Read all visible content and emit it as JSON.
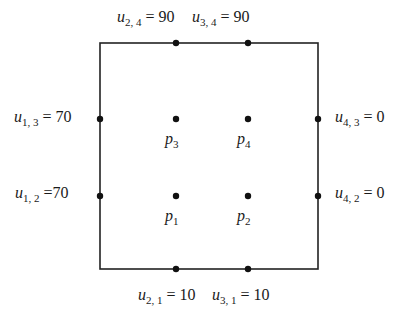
{
  "diagram": {
    "type": "grid-boundary-value-problem",
    "box": {
      "x": 100,
      "y": 43,
      "width": 218,
      "height": 226,
      "stroke": "#222222"
    },
    "boundary_labels": [
      {
        "id": "u24",
        "var": "u",
        "sub": "2, 4",
        "eq": "= 90",
        "x": 117,
        "y": 9
      },
      {
        "id": "u34",
        "var": "u",
        "sub": "3, 4",
        "eq": "= 90",
        "x": 192,
        "y": 9
      },
      {
        "id": "u13",
        "var": "u",
        "sub": "1, 3",
        "eq": "= 70",
        "x": 14,
        "y": 109
      },
      {
        "id": "u12",
        "var": "u",
        "sub": "1, 2",
        "eq": "=70",
        "x": 15,
        "y": 185
      },
      {
        "id": "u43",
        "var": "u",
        "sub": "4, 3",
        "eq": "= 0",
        "x": 335,
        "y": 109
      },
      {
        "id": "u42",
        "var": "u",
        "sub": "4, 2",
        "eq": "= 0",
        "x": 335,
        "y": 185
      },
      {
        "id": "u21",
        "var": "u",
        "sub": "2, 1",
        "eq": "= 10",
        "x": 138,
        "y": 287
      },
      {
        "id": "u31",
        "var": "u",
        "sub": "3, 1",
        "eq": "= 10",
        "x": 212,
        "y": 287
      }
    ],
    "boundary_points": [
      {
        "id": "u24",
        "cx": 176,
        "cy": 43
      },
      {
        "id": "u34",
        "cx": 248,
        "cy": 43
      },
      {
        "id": "u13",
        "cx": 100,
        "cy": 119
      },
      {
        "id": "u12",
        "cx": 100,
        "cy": 196
      },
      {
        "id": "u43",
        "cx": 318,
        "cy": 119
      },
      {
        "id": "u42",
        "cx": 318,
        "cy": 196
      },
      {
        "id": "u21",
        "cx": 176,
        "cy": 269
      },
      {
        "id": "u31",
        "cx": 248,
        "cy": 269
      }
    ],
    "interior_points": [
      {
        "id": "p3",
        "var": "p",
        "sub": "3",
        "cx": 176,
        "cy": 119,
        "lx": 165,
        "ly": 131
      },
      {
        "id": "p4",
        "var": "p",
        "sub": "4",
        "cx": 248,
        "cy": 119,
        "lx": 237,
        "ly": 131
      },
      {
        "id": "p1",
        "var": "p",
        "sub": "1",
        "cx": 176,
        "cy": 196,
        "lx": 165,
        "ly": 208
      },
      {
        "id": "p2",
        "var": "p",
        "sub": "2",
        "cx": 248,
        "cy": 196,
        "lx": 237,
        "ly": 208
      }
    ],
    "point_color": "#111111"
  }
}
